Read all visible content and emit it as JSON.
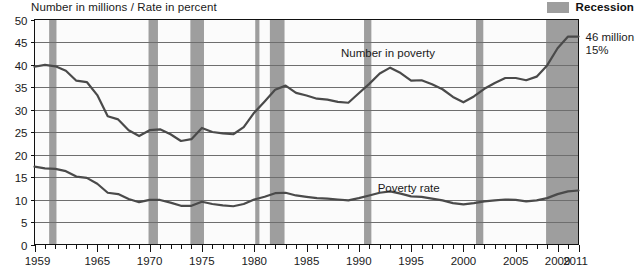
{
  "header": {
    "axis_title": "Number in millions / Rate in percent",
    "legend_label": "Recession",
    "legend_swatch_color": "#9e9e9e"
  },
  "annotations": {
    "series_label_number": "Number in poverty",
    "series_label_rate": "Poverty rate",
    "callout_number": "46 million",
    "callout_rate": "15%"
  },
  "chart_data": {
    "type": "line",
    "title": "",
    "subtitle": "",
    "xlabel": "",
    "ylabel": "Number in millions / Rate in percent",
    "ylim": [
      0,
      50
    ],
    "ytick_values": [
      0,
      5,
      10,
      15,
      20,
      25,
      30,
      35,
      40,
      45,
      50
    ],
    "ytick_labels": [
      "0",
      "5",
      "10",
      "15",
      "20",
      "25",
      "30",
      "35",
      "40",
      "45",
      "50"
    ],
    "xlim": [
      1959,
      2011
    ],
    "xtick_labels": [
      "1959",
      "1965",
      "1970",
      "1975",
      "1980",
      "1985",
      "1990",
      "1995",
      "2000",
      "2005",
      "2009",
      "2011"
    ],
    "xtick_values": [
      1959,
      1965,
      1970,
      1975,
      1980,
      1985,
      1990,
      1995,
      2000,
      2005,
      2009,
      2011
    ],
    "minor_ticks": "every year",
    "grid": "horizontal",
    "legend_position": "top-right",
    "line_color": "#4a4a4a",
    "x": [
      1959,
      1960,
      1961,
      1962,
      1963,
      1964,
      1965,
      1966,
      1967,
      1968,
      1969,
      1970,
      1971,
      1972,
      1973,
      1974,
      1975,
      1976,
      1977,
      1978,
      1979,
      1980,
      1981,
      1982,
      1983,
      1984,
      1985,
      1986,
      1987,
      1988,
      1989,
      1990,
      1991,
      1992,
      1993,
      1994,
      1995,
      1996,
      1997,
      1998,
      1999,
      2000,
      2001,
      2002,
      2003,
      2004,
      2005,
      2006,
      2007,
      2008,
      2009,
      2010,
      2011
    ],
    "series": [
      {
        "name": "Number in poverty",
        "unit": "millions",
        "end_value_label": "46 million",
        "values": [
          39.5,
          39.9,
          39.6,
          38.6,
          36.4,
          36.1,
          33.2,
          28.5,
          27.8,
          25.4,
          24.1,
          25.4,
          25.6,
          24.5,
          23.0,
          23.4,
          25.9,
          25.0,
          24.7,
          24.5,
          26.1,
          29.3,
          31.8,
          34.4,
          35.3,
          33.7,
          33.1,
          32.4,
          32.2,
          31.7,
          31.5,
          33.6,
          35.7,
          38.0,
          39.3,
          38.1,
          36.4,
          36.5,
          35.6,
          34.5,
          32.8,
          31.6,
          32.9,
          34.6,
          35.9,
          37.0,
          37.0,
          36.5,
          37.3,
          39.8,
          43.6,
          46.2,
          46.2
        ]
      },
      {
        "name": "Poverty rate",
        "unit": "percent",
        "end_value_label": "15%",
        "values": [
          17.3,
          16.9,
          16.8,
          16.3,
          15.1,
          14.8,
          13.5,
          11.5,
          11.2,
          10.1,
          9.4,
          9.9,
          9.9,
          9.3,
          8.6,
          8.6,
          9.5,
          9.0,
          8.7,
          8.5,
          9.0,
          10.0,
          10.6,
          11.4,
          11.5,
          10.9,
          10.6,
          10.3,
          10.2,
          10.0,
          9.8,
          10.3,
          10.9,
          11.5,
          11.8,
          11.3,
          10.7,
          10.6,
          10.2,
          9.8,
          9.2,
          8.9,
          9.2,
          9.6,
          9.8,
          10.0,
          9.9,
          9.6,
          9.8,
          10.3,
          11.2,
          11.8,
          12.0
        ]
      }
    ],
    "recessions": [
      {
        "label": "1960-61",
        "start": 1960.4,
        "end": 1961.1
      },
      {
        "label": "1969-70",
        "start": 1969.9,
        "end": 1970.8
      },
      {
        "label": "1973-75",
        "start": 1973.9,
        "end": 1975.2
      },
      {
        "label": "1980",
        "start": 1980.1,
        "end": 1980.5
      },
      {
        "label": "1981-82",
        "start": 1981.5,
        "end": 1982.9
      },
      {
        "label": "1990-91",
        "start": 1990.5,
        "end": 1991.2
      },
      {
        "label": "2001",
        "start": 2001.2,
        "end": 2001.9
      },
      {
        "label": "2007-2011",
        "start": 2007.9,
        "end": 2011.0
      }
    ]
  }
}
